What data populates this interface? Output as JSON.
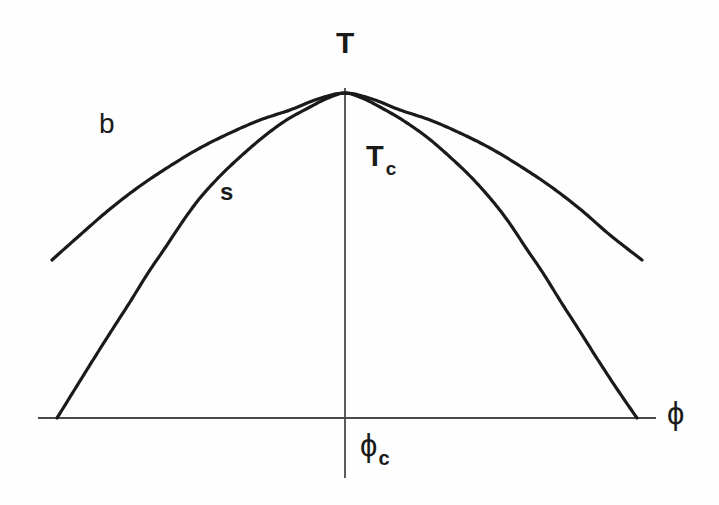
{
  "figure": {
    "background_color": "#fefefe",
    "ink_color": "#1a1a1a",
    "axis_color": "#4a4a4a",
    "width": 719,
    "height": 505
  },
  "labels": {
    "y_axis": "T",
    "x_axis": "ϕ",
    "critical_temperature": "T",
    "critical_temperature_sub": "c",
    "critical_composition": "ϕ",
    "critical_composition_sub": "c",
    "binodal": "b",
    "spinodal": "s"
  },
  "chart_data": {
    "type": "line",
    "title": "",
    "xlabel": "ϕ",
    "ylabel": "T",
    "grid": false,
    "legend": "inline-curve-labels",
    "axes": {
      "x_axis_y_pixel": 418,
      "x_axis_x_start": 38,
      "x_axis_x_end": 656,
      "y_axis_x_pixel": 345,
      "y_axis_y_top": 88,
      "y_axis_y_bottom": 478
    },
    "annotations": [
      {
        "text": "T",
        "role": "y-axis-name",
        "x": 345,
        "y": 42
      },
      {
        "text": "Tc",
        "role": "critical-temperature-marker",
        "x": 380,
        "y": 160
      },
      {
        "text": "b",
        "role": "binodal-curve-label",
        "x": 108,
        "y": 124
      },
      {
        "text": "s",
        "role": "spinodal-curve-label",
        "x": 228,
        "y": 192
      },
      {
        "text": "ϕ",
        "role": "x-axis-name",
        "x": 675,
        "y": 414
      },
      {
        "text": "ϕc",
        "role": "critical-composition-marker",
        "x": 378,
        "y": 448
      }
    ],
    "series": [
      {
        "name": "b",
        "description": "binodal (coexistence) curve — broad outer dome, drawn truncated above the axis",
        "points": [
          [
            52,
            260
          ],
          [
            80,
            235
          ],
          [
            110,
            209
          ],
          [
            140,
            186
          ],
          [
            170,
            166
          ],
          [
            200,
            148
          ],
          [
            230,
            133
          ],
          [
            260,
            120
          ],
          [
            290,
            110
          ],
          [
            318,
            99
          ],
          [
            345,
            93
          ],
          [
            372,
            99
          ],
          [
            400,
            110
          ],
          [
            430,
            120
          ],
          [
            460,
            133
          ],
          [
            490,
            148
          ],
          [
            520,
            166
          ],
          [
            550,
            186
          ],
          [
            580,
            209
          ],
          [
            610,
            235
          ],
          [
            642,
            260
          ]
        ]
      },
      {
        "name": "s",
        "description": "spinodal curve — narrower inner dome meeting the ϕ axis at both ends, tangent to the binodal at the critical point",
        "points": [
          [
            57,
            418
          ],
          [
            75,
            389
          ],
          [
            93,
            360
          ],
          [
            112,
            330
          ],
          [
            130,
            302
          ],
          [
            148,
            273
          ],
          [
            165,
            248
          ],
          [
            183,
            221
          ],
          [
            200,
            198
          ],
          [
            220,
            176
          ],
          [
            240,
            157
          ],
          [
            262,
            138
          ],
          [
            285,
            121
          ],
          [
            310,
            107
          ],
          [
            328,
            98
          ],
          [
            345,
            93
          ],
          [
            362,
            98
          ],
          [
            380,
            107
          ],
          [
            404,
            121
          ],
          [
            428,
            138
          ],
          [
            450,
            157
          ],
          [
            470,
            176
          ],
          [
            490,
            198
          ],
          [
            508,
            221
          ],
          [
            526,
            248
          ],
          [
            543,
            273
          ],
          [
            561,
            302
          ],
          [
            579,
            330
          ],
          [
            598,
            360
          ],
          [
            617,
            389
          ],
          [
            637,
            418
          ]
        ]
      }
    ]
  }
}
